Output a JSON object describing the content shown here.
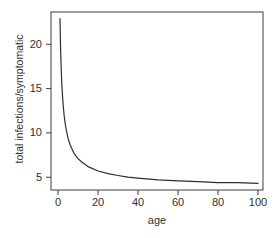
{
  "chart_data": {
    "type": "line",
    "title": "",
    "xlabel": "age",
    "ylabel": "total infections/symptomatic",
    "xlim": [
      -3.5,
      102.5
    ],
    "ylim": [
      3.56,
      23.64
    ],
    "x_ticks": [
      0,
      20,
      40,
      60,
      80,
      100
    ],
    "y_ticks": [
      5,
      10,
      15,
      20
    ],
    "grid": false,
    "legend": false,
    "background": "#ffffff",
    "line_color": "#2e2e2e",
    "axis_color": "#3c3c3c",
    "text_color": "#303030",
    "series": [
      {
        "name": "total infections per symptomatic infection",
        "x": [
          1,
          1.25,
          1.5,
          1.75,
          2,
          2.5,
          3,
          3.5,
          4,
          5,
          6,
          7,
          8,
          10,
          12,
          15,
          20,
          25,
          30,
          35,
          40,
          50,
          60,
          70,
          80,
          90,
          100
        ],
        "y": [
          22.9,
          19.9,
          17.9,
          16.3,
          15.1,
          13.4,
          12.1,
          11.2,
          10.5,
          9.4,
          8.7,
          8.2,
          7.7,
          7.1,
          6.7,
          6.2,
          5.7,
          5.4,
          5.2,
          5.0,
          4.9,
          4.7,
          4.6,
          4.5,
          4.4,
          4.4,
          4.3
        ]
      }
    ]
  }
}
